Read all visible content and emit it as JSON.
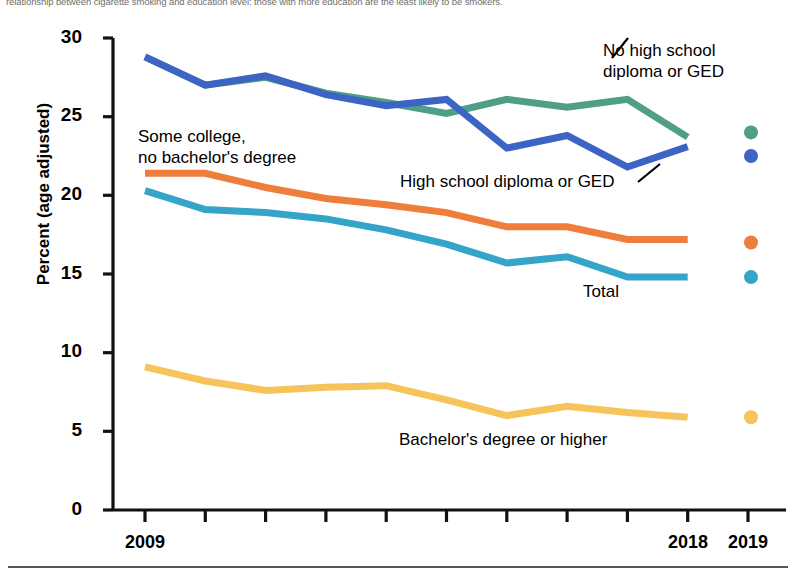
{
  "caption": {
    "text": "relationship between cigarette smoking and education level: those with more education are the least likely to be smokers."
  },
  "axes": {
    "ylabel": "Percent (age adjusted)",
    "yticks": [
      "0",
      "5",
      "10",
      "15",
      "20",
      "25",
      "30"
    ],
    "xticks_visible": [
      "2009",
      "2018",
      "2019"
    ]
  },
  "annotations": {
    "no_hs": "No high school\ndiploma or GED",
    "some_college": "Some college,\nno bachelor's degree",
    "hs_diploma": "High school diploma or GED",
    "total": "Total",
    "bachelors": "Bachelor's degree or higher"
  },
  "colors": {
    "no_high_school": "#4f9e87",
    "high_school": "#3b64c4",
    "some_college": "#ef7d3c",
    "total": "#35a4c9",
    "bachelors": "#f6c45a",
    "axis": "#111111",
    "caption": "#6e6e6e"
  },
  "chart_data": {
    "type": "line",
    "title": "",
    "xlabel": "",
    "ylabel": "Percent (age adjusted)",
    "ylim": [
      0,
      30
    ],
    "grid": false,
    "legend": "inline-annotations",
    "x": [
      2009,
      2010,
      2011,
      2012,
      2013,
      2014,
      2015,
      2016,
      2017,
      2018,
      2019
    ],
    "note_2019": "2019 values plotted as separate markers (break in series)",
    "series": [
      {
        "name": "No high school diploma or GED",
        "color": "#4f9e87",
        "values": [
          28.8,
          27.0,
          27.5,
          26.5,
          25.9,
          25.2,
          26.1,
          25.6,
          26.1,
          23.7,
          24.0
        ]
      },
      {
        "name": "High school diploma or GED",
        "color": "#3b64c4",
        "values": [
          28.8,
          27.0,
          27.6,
          26.4,
          25.7,
          26.1,
          23.0,
          23.8,
          21.8,
          23.1,
          22.5
        ]
      },
      {
        "name": "Some college, no bachelor's degree",
        "color": "#ef7d3c",
        "values": [
          21.4,
          21.4,
          20.5,
          19.8,
          19.4,
          18.9,
          18.0,
          18.0,
          17.2,
          17.2,
          17.0
        ]
      },
      {
        "name": "Total",
        "color": "#35a4c9",
        "values": [
          20.3,
          19.1,
          18.9,
          18.5,
          17.8,
          16.9,
          15.7,
          16.1,
          14.8,
          14.8,
          14.8
        ]
      },
      {
        "name": "Bachelor's degree or higher",
        "color": "#f6c45a",
        "values": [
          9.1,
          8.2,
          7.6,
          7.8,
          7.9,
          7.0,
          6.0,
          6.6,
          6.2,
          5.9,
          5.9
        ]
      }
    ]
  }
}
